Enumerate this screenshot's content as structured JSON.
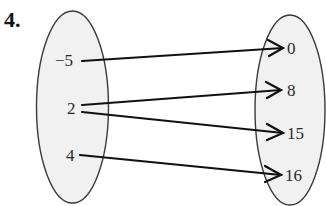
{
  "problem_number": "4.",
  "diagram": {
    "type": "mapping",
    "domain": {
      "label": "domain-set",
      "values": [
        "−5",
        "2",
        "4"
      ]
    },
    "range": {
      "label": "range-set",
      "values": [
        "0",
        "8",
        "15",
        "16"
      ]
    },
    "mappings": [
      {
        "from": "−5",
        "to": "0"
      },
      {
        "from": "2",
        "to": "8"
      },
      {
        "from": "2",
        "to": "15"
      },
      {
        "from": "4",
        "to": "16"
      }
    ],
    "colors": {
      "ellipse_fill": "#f1f1f1",
      "ellipse_stroke": "#3a3a3a",
      "arrow": "#111111",
      "text": "#2a2a2a"
    }
  }
}
